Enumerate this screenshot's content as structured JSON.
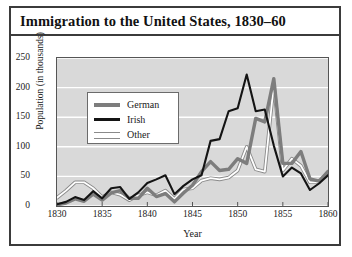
{
  "chart_data": {
    "type": "line",
    "title": "Immigration to the United States, 1830–60",
    "xlabel": "Year",
    "ylabel": "Population (in thousands)",
    "xlim": [
      1830,
      1860
    ],
    "ylim": [
      0,
      250
    ],
    "xticks": [
      1830,
      1835,
      1840,
      1845,
      1850,
      1855,
      1860
    ],
    "yticks": [
      0,
      50,
      100,
      150,
      200,
      250
    ],
    "grid": "horizontal-white",
    "legend_position": "upper-left-inside",
    "plot_background": "#d9d9d9",
    "x": [
      1830,
      1831,
      1832,
      1833,
      1834,
      1835,
      1836,
      1837,
      1838,
      1839,
      1840,
      1841,
      1842,
      1843,
      1844,
      1845,
      1846,
      1847,
      1848,
      1849,
      1850,
      1851,
      1852,
      1853,
      1854,
      1855,
      1856,
      1857,
      1858,
      1859,
      1860
    ],
    "series": [
      {
        "name": "German",
        "color": "#7d7d7d",
        "style": "thick-gray",
        "values": [
          2,
          5,
          12,
          8,
          20,
          10,
          22,
          26,
          13,
          13,
          30,
          16,
          21,
          7,
          22,
          35,
          58,
          75,
          60,
          62,
          80,
          72,
          148,
          142,
          215,
          72,
          72,
          92,
          46,
          42,
          58
        ]
      },
      {
        "name": "Irish",
        "color": "#141414",
        "style": "thick-black",
        "values": [
          3,
          7,
          15,
          10,
          25,
          13,
          30,
          32,
          12,
          23,
          39,
          45,
          52,
          20,
          34,
          45,
          52,
          110,
          113,
          160,
          165,
          222,
          160,
          163,
          102,
          50,
          65,
          55,
          27,
          38,
          52
        ]
      },
      {
        "name": "Other",
        "color": "#ffffff",
        "outline": "#8a8a8a",
        "style": "thin-outlined",
        "values": [
          14,
          26,
          40,
          40,
          30,
          15,
          23,
          19,
          10,
          18,
          23,
          18,
          26,
          12,
          28,
          30,
          43,
          47,
          45,
          48,
          60,
          100,
          62,
          58,
          205,
          60,
          80,
          68,
          40,
          40,
          58
        ]
      }
    ]
  },
  "legend": {
    "items": [
      {
        "label": "German",
        "swatch": "thick-gray-line"
      },
      {
        "label": "Irish",
        "swatch": "thick-black-line"
      },
      {
        "label": "Other",
        "swatch": "thin-outlined-line"
      }
    ]
  }
}
